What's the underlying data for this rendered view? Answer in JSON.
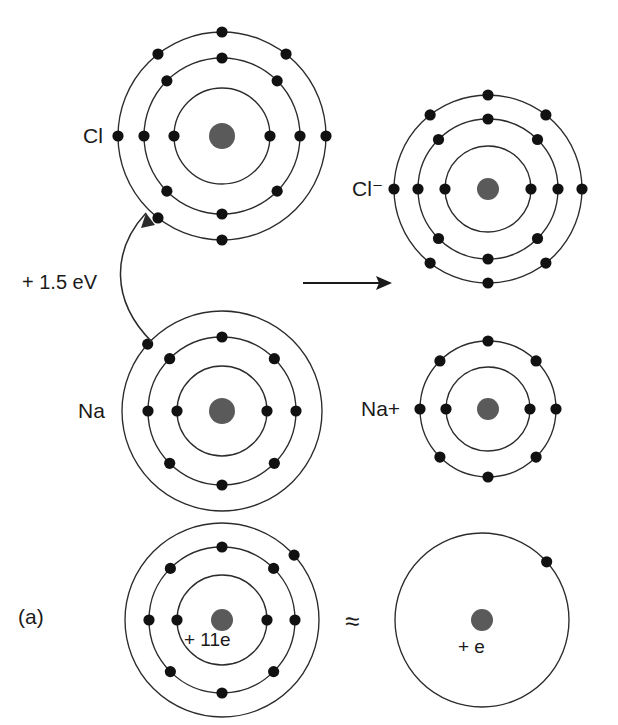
{
  "figure": {
    "panel_label": "(a)",
    "energy_label": "+  1.5 eV",
    "approx_symbol": "≈",
    "reaction_arrow": "→"
  },
  "atoms": {
    "chlorine_neutral": {
      "label": "Cl",
      "cx": 222,
      "cy": 136,
      "nucleus_r": 13,
      "shell_radii": [
        48,
        78,
        104
      ],
      "shell_counts": [
        2,
        8,
        7
      ],
      "shell_angles": [
        [
          0,
          180
        ],
        [
          0,
          45,
          90,
          135,
          180,
          225,
          270,
          315
        ],
        [
          0,
          52,
          90,
          128,
          180,
          232,
          270,
          308
        ]
      ],
      "outer_missing_index": 7
    },
    "chloride_ion": {
      "label": "Cl⁻",
      "cx": 488,
      "cy": 189,
      "nucleus_r": 11,
      "shell_radii": [
        43,
        70,
        94
      ],
      "shell_counts": [
        2,
        8,
        8
      ],
      "shell_angles": [
        [
          0,
          180
        ],
        [
          0,
          45,
          90,
          135,
          180,
          225,
          270,
          315
        ],
        [
          0,
          52,
          90,
          128,
          180,
          232,
          270,
          308
        ]
      ]
    },
    "sodium_neutral": {
      "label": "Na",
      "cx": 222,
      "cy": 411,
      "nucleus_r": 13,
      "shell_radii": [
        45,
        74,
        100
      ],
      "shell_counts": [
        2,
        8,
        1
      ],
      "shell_angles": [
        [
          0,
          180
        ],
        [
          0,
          45,
          90,
          135,
          180,
          225,
          270,
          315
        ],
        [
          138
        ]
      ]
    },
    "sodium_ion": {
      "label": "Na+",
      "cx": 488,
      "cy": 409,
      "nucleus_r": 11,
      "shell_radii": [
        42,
        68
      ],
      "shell_counts": [
        2,
        8
      ],
      "shell_angles": [
        [
          0,
          180
        ],
        [
          0,
          45,
          90,
          135,
          180,
          225,
          270,
          315
        ]
      ]
    },
    "sodium_full_model": {
      "nucleus_label": "+ 11e",
      "cx": 222,
      "cy": 620,
      "nucleus_r": 11,
      "shell_radii": [
        45,
        73,
        97
      ],
      "shell_counts": [
        2,
        8,
        1
      ],
      "shell_angles": [
        [
          0,
          180
        ],
        [
          0,
          45,
          90,
          135,
          180,
          225,
          270,
          315
        ],
        [
          42
        ]
      ]
    },
    "sodium_simplified_model": {
      "nucleus_label": "+ e",
      "cx": 482,
      "cy": 620,
      "nucleus_r": 11,
      "shell_radii": [
        87
      ],
      "shell_counts": [
        1
      ],
      "shell_angles": [
        [
          42
        ]
      ]
    }
  }
}
